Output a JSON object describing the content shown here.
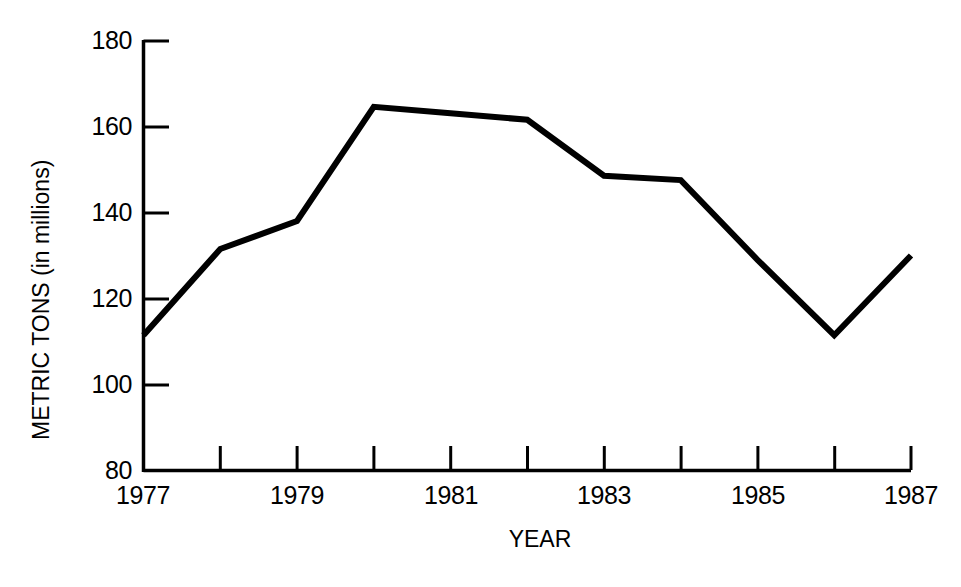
{
  "chart_data": {
    "type": "line",
    "title": "",
    "subtitle": "",
    "xlabel": "YEAR",
    "ylabel": "METRIC TONS (in millions)",
    "x": [
      1977,
      1978,
      1979,
      1980,
      1981,
      1982,
      1983,
      1984,
      1985,
      1986,
      1987
    ],
    "values": [
      111.5,
      131.5,
      138,
      164.5,
      163,
      161.5,
      148.5,
      147.5,
      129,
      111.5,
      130
    ],
    "series": [
      {
        "name": "Metric tons",
        "values": [
          111.5,
          131.5,
          138,
          164.5,
          163,
          161.5,
          148.5,
          147.5,
          129,
          111.5,
          130
        ]
      }
    ],
    "xlim": [
      1977,
      1987
    ],
    "ylim": [
      80,
      180
    ],
    "x_tick_values": [
      1977,
      1978,
      1979,
      1980,
      1981,
      1982,
      1983,
      1984,
      1985,
      1986,
      1987
    ],
    "x_tick_labels": [
      "1977",
      "",
      "1979",
      "",
      "1981",
      "",
      "1983",
      "",
      "1985",
      "",
      "1987"
    ],
    "y_ticks": [
      80,
      100,
      120,
      140,
      160,
      180
    ],
    "y_tick_labels": [
      "80",
      "100",
      "120",
      "140",
      "160",
      "180"
    ],
    "grid": false,
    "legend": false,
    "legend_position": "none",
    "annotations": [],
    "line_color": "#000000",
    "axis_color": "#000000",
    "background_color": "#ffffff"
  },
  "axes": {
    "x_title": "YEAR",
    "y_title": "METRIC TONS (in millions)"
  },
  "y_labels": [
    "180",
    "160",
    "140",
    "120",
    "100",
    "80"
  ],
  "x_labels": [
    "1977",
    "1979",
    "1981",
    "1983",
    "1985",
    "1987"
  ]
}
